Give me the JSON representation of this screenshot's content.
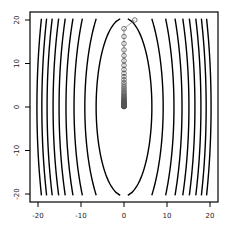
{
  "chart_data": {
    "type": "contour",
    "title": "",
    "xlabel": "",
    "ylabel": "",
    "xlim": [
      -22,
      22
    ],
    "ylim": [
      -22,
      22
    ],
    "grid": false,
    "legend": null,
    "x_ticks": [
      -20,
      -10,
      0,
      10,
      20
    ],
    "y_ticks": [
      -20,
      -10,
      0,
      10,
      20
    ],
    "x_tick_labels": [
      "-20",
      "-10",
      "0",
      "10",
      "20"
    ],
    "y_tick_labels": [
      "-20",
      "-10",
      "0",
      "10",
      "20"
    ],
    "function": "f(x,y) = x^2 + y^2/10",
    "contour_levels": [
      42,
      83,
      135,
      182,
      228,
      272,
      320,
      365,
      410
    ],
    "contour_color": "#000000",
    "path": {
      "description": "gradient descent iterates, learning rate 0.5",
      "start": [
        2.5,
        20
      ],
      "x_factor": 0.0,
      "y_factor": 0.9,
      "iterations": 50,
      "marker": "open-circle",
      "marker_color": "#555555",
      "line_color": "#888888"
    }
  }
}
